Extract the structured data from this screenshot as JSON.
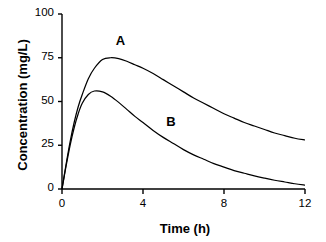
{
  "chart_data": {
    "type": "line",
    "title": "",
    "xlabel": "Time (h)",
    "ylabel": "Concentration  (mg/L)",
    "xlim": [
      0,
      12
    ],
    "ylim": [
      0,
      100
    ],
    "xticks": [
      "0",
      "4",
      "8",
      "12"
    ],
    "xtick_values": [
      0,
      4,
      8,
      12
    ],
    "yticks": [
      "0",
      "25",
      "50",
      "75",
      "100"
    ],
    "ytick_values": [
      0,
      25,
      50,
      75,
      100
    ],
    "grid": false,
    "legend": "inline-curve-labels",
    "line_color": "#000000",
    "series": [
      {
        "name": "A",
        "label": "A",
        "label_x": 2.9,
        "label_y": 84,
        "peak_time": 2.4,
        "peak_value": 75,
        "x": [
          0,
          0.2,
          0.4,
          0.6,
          0.8,
          1.0,
          1.3,
          1.6,
          2.0,
          2.4,
          2.8,
          3.2,
          3.6,
          4.0,
          4.5,
          5.0,
          5.5,
          6.0,
          6.5,
          7.0,
          7.5,
          8.0,
          8.5,
          9.0,
          9.5,
          10.0,
          10.5,
          11.0,
          11.5,
          12.0
        ],
        "y": [
          0,
          14,
          27,
          38,
          47,
          54,
          63,
          69,
          74,
          75,
          74.5,
          73,
          71,
          69,
          66,
          62.5,
          59,
          55.5,
          52,
          49,
          46,
          43,
          40.5,
          38,
          36,
          34,
          32,
          30.5,
          29,
          28
        ]
      },
      {
        "name": "B",
        "label": "B",
        "label_x": 5.4,
        "label_y": 38,
        "peak_time": 1.7,
        "peak_value": 56,
        "x": [
          0,
          0.2,
          0.4,
          0.6,
          0.8,
          1.0,
          1.3,
          1.6,
          2.0,
          2.4,
          2.8,
          3.2,
          3.6,
          4.0,
          4.5,
          5.0,
          5.5,
          6.0,
          6.5,
          7.0,
          7.5,
          8.0,
          8.5,
          9.0,
          9.5,
          10.0,
          10.5,
          11.0,
          11.5,
          12.0
        ],
        "y": [
          0,
          13,
          25,
          35,
          43,
          49,
          54,
          56,
          55.5,
          53,
          49.5,
          45.5,
          41.5,
          38,
          33.5,
          29.5,
          26,
          22.5,
          19.5,
          17,
          14.5,
          12.5,
          10.5,
          9,
          7.5,
          6.2,
          5.0,
          4.0,
          3.0,
          2.2
        ]
      }
    ]
  },
  "axes": {
    "x_title": "Time (h)",
    "y_title": "Concentration  (mg/L)"
  }
}
